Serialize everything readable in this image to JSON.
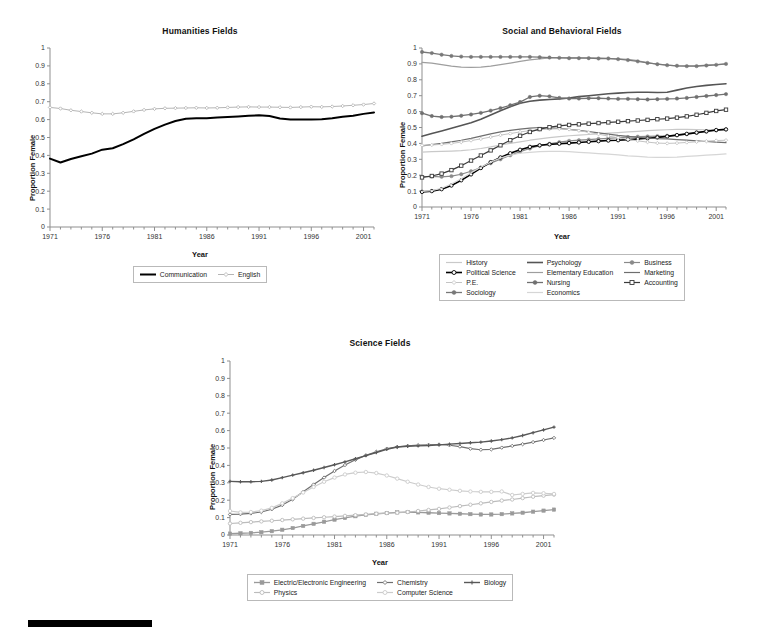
{
  "page": {
    "background": "#ffffff",
    "footer_rule": {
      "name": "black-rule",
      "color": "#000000"
    }
  },
  "charts": [
    {
      "id": "humanities",
      "title": "Humanities Fields",
      "xlabel": "Year",
      "ylabel": "Proportion Female",
      "ylim": [
        0,
        1
      ],
      "ytick_labels": [
        "1",
        "0.9",
        "0.8",
        "0.7",
        "0.6",
        "0.5",
        "0.4",
        "0.3",
        "0.2",
        "0.1",
        "0"
      ],
      "xlim": [
        1971,
        2002
      ],
      "xtick_labels": [
        "1971",
        "1976",
        "1981",
        "1986",
        "1991",
        "1996",
        "2001"
      ],
      "legend_columns": 2,
      "legend": [
        "Communication",
        "English"
      ]
    },
    {
      "id": "social",
      "title": "Social and Behavioral Fields",
      "xlabel": "Year",
      "ylabel": "Proportion Female",
      "ylim": [
        0,
        1
      ],
      "ytick_labels": [
        "1",
        "0.9",
        "0.8",
        "0.7",
        "0.6",
        "0.5",
        "0.4",
        "0.3",
        "0.2",
        "0.1",
        "0"
      ],
      "xlim": [
        1971,
        2002
      ],
      "xtick_labels": [
        "1971",
        "1976",
        "1981",
        "1986",
        "1991",
        "1996",
        "2001"
      ],
      "legend_columns": 3,
      "legend": [
        "History",
        "Psychology",
        "Business",
        "Political Science",
        "Elementary Education",
        "Marketing",
        "P.E.",
        "Nursing",
        "Accounting",
        "Sociology",
        "Economics"
      ]
    },
    {
      "id": "science",
      "title": "Science Fields",
      "xlabel": "Year",
      "ylabel": "Proportion Female",
      "ylim": [
        0,
        1
      ],
      "ytick_labels": [
        "1",
        "0.9",
        "0.8",
        "0.7",
        "0.6",
        "0.5",
        "0.4",
        "0.3",
        "0.2",
        "0.1",
        "0"
      ],
      "xlim": [
        1971,
        2002
      ],
      "xtick_labels": [
        "1971",
        "1976",
        "1981",
        "1986",
        "1991",
        "1996",
        "2001"
      ],
      "legend_columns": 3,
      "legend": [
        "Electric/Electronic Engineering",
        "Chemistry",
        "Biology",
        "Physics",
        "Computer Science"
      ]
    }
  ],
  "chart_data": [
    {
      "type": "line",
      "title": "Humanities Fields",
      "xlabel": "Year",
      "ylabel": "Proportion Female",
      "ylim": [
        0,
        1
      ],
      "xlim": [
        1971,
        2002
      ],
      "grid": false,
      "legend_position": "below",
      "x": [
        1971,
        1972,
        1973,
        1974,
        1975,
        1976,
        1977,
        1978,
        1979,
        1980,
        1981,
        1982,
        1983,
        1984,
        1985,
        1986,
        1987,
        1988,
        1989,
        1990,
        1991,
        1992,
        1993,
        1994,
        1995,
        1996,
        1997,
        1998,
        1999,
        2000,
        2001,
        2002
      ],
      "series": [
        {
          "name": "Communication",
          "color": "#000000",
          "marker": "none",
          "linewidth": 2.0,
          "values": [
            0.382,
            0.36,
            0.38,
            0.395,
            0.41,
            0.432,
            0.44,
            0.463,
            0.49,
            0.52,
            0.548,
            0.572,
            0.592,
            0.605,
            0.608,
            0.608,
            0.612,
            0.615,
            0.618,
            0.622,
            0.624,
            0.62,
            0.606,
            0.6,
            0.601,
            0.6,
            0.602,
            0.608,
            0.616,
            0.622,
            0.632,
            0.64
          ]
        },
        {
          "name": "English",
          "color": "#b5b5b5",
          "marker": "diamond",
          "linewidth": 1.0,
          "values": [
            0.668,
            0.662,
            0.652,
            0.645,
            0.638,
            0.632,
            0.632,
            0.638,
            0.646,
            0.654,
            0.66,
            0.663,
            0.664,
            0.665,
            0.666,
            0.665,
            0.666,
            0.668,
            0.67,
            0.671,
            0.67,
            0.67,
            0.669,
            0.668,
            0.67,
            0.672,
            0.671,
            0.673,
            0.676,
            0.68,
            0.684,
            0.69
          ]
        }
      ]
    },
    {
      "type": "line",
      "title": "Social and Behavioral Fields",
      "xlabel": "Year",
      "ylabel": "Proportion Female",
      "ylim": [
        0,
        1
      ],
      "xlim": [
        1971,
        2002
      ],
      "grid": false,
      "legend_position": "below",
      "x": [
        1971,
        1972,
        1973,
        1974,
        1975,
        1976,
        1977,
        1978,
        1979,
        1980,
        1981,
        1982,
        1983,
        1984,
        1985,
        1986,
        1987,
        1988,
        1989,
        1990,
        1991,
        1992,
        1993,
        1994,
        1995,
        1996,
        1997,
        1998,
        1999,
        2000,
        2001,
        2002
      ],
      "series": [
        {
          "name": "History",
          "color": "#c9c9c9",
          "marker": "none",
          "linewidth": 1.2,
          "values": [
            0.345,
            0.348,
            0.35,
            0.352,
            0.355,
            0.36,
            0.368,
            0.378,
            0.39,
            0.4,
            0.41,
            0.42,
            0.428,
            0.436,
            0.442,
            0.448,
            0.452,
            0.456,
            0.46,
            0.464,
            0.468,
            0.472,
            0.476,
            0.48,
            0.483,
            0.486,
            0.488,
            0.488,
            0.487,
            0.486,
            0.486,
            0.488
          ]
        },
        {
          "name": "Psychology",
          "color": "#555555",
          "marker": "none",
          "linewidth": 1.6,
          "values": [
            0.445,
            0.462,
            0.478,
            0.495,
            0.512,
            0.53,
            0.552,
            0.578,
            0.605,
            0.63,
            0.652,
            0.665,
            0.672,
            0.676,
            0.68,
            0.686,
            0.694,
            0.7,
            0.706,
            0.712,
            0.716,
            0.72,
            0.722,
            0.722,
            0.72,
            0.722,
            0.735,
            0.748,
            0.758,
            0.765,
            0.77,
            0.775
          ]
        },
        {
          "name": "Business",
          "color": "#8a8a8a",
          "marker": "circle-filled",
          "linewidth": 1.2,
          "values": [
            0.19,
            0.192,
            0.19,
            0.194,
            0.206,
            0.225,
            0.248,
            0.275,
            0.3,
            0.325,
            0.348,
            0.368,
            0.385,
            0.398,
            0.408,
            0.416,
            0.42,
            0.424,
            0.428,
            0.432,
            0.436,
            0.44,
            0.442,
            0.444,
            0.446,
            0.448,
            0.452,
            0.458,
            0.466,
            0.474,
            0.482,
            0.488
          ]
        },
        {
          "name": "Political Science",
          "color": "#000000",
          "marker": "circle-open",
          "linewidth": 1.6,
          "values": [
            0.095,
            0.1,
            0.112,
            0.135,
            0.168,
            0.205,
            0.245,
            0.282,
            0.312,
            0.338,
            0.36,
            0.378,
            0.388,
            0.394,
            0.398,
            0.402,
            0.406,
            0.41,
            0.414,
            0.418,
            0.42,
            0.424,
            0.428,
            0.432,
            0.438,
            0.444,
            0.452,
            0.46,
            0.468,
            0.476,
            0.484,
            0.488
          ]
        },
        {
          "name": "Elementary Education",
          "color": "#9e9e9e",
          "marker": "none",
          "linewidth": 1.2,
          "values": [
            0.91,
            0.905,
            0.895,
            0.886,
            0.88,
            0.878,
            0.88,
            0.886,
            0.895,
            0.905,
            0.916,
            0.925,
            0.932,
            0.938,
            0.94,
            0.94,
            0.94,
            0.938,
            0.936,
            0.934,
            0.932,
            0.928,
            0.92,
            0.908,
            0.898,
            0.892,
            0.888,
            0.888,
            0.888,
            0.892,
            0.896,
            0.9
          ]
        },
        {
          "name": "Marketing",
          "color": "#6e6e6e",
          "marker": "none",
          "linewidth": 1.2,
          "values": [
            0.385,
            0.392,
            0.4,
            0.41,
            0.42,
            0.432,
            0.446,
            0.46,
            0.472,
            0.482,
            0.49,
            0.496,
            0.5,
            0.498,
            0.494,
            0.488,
            0.482,
            0.474,
            0.466,
            0.458,
            0.45,
            0.444,
            0.438,
            0.434,
            0.43,
            0.428,
            0.424,
            0.42,
            0.416,
            0.412,
            0.408,
            0.405
          ]
        },
        {
          "name": "P.E.",
          "color": "#c4c4c4",
          "marker": "diamond",
          "linewidth": 1.0,
          "values": [
            0.388,
            0.39,
            0.394,
            0.4,
            0.408,
            0.418,
            0.428,
            0.44,
            0.452,
            0.462,
            0.472,
            0.48,
            0.486,
            0.49,
            0.492,
            0.488,
            0.48,
            0.47,
            0.458,
            0.446,
            0.436,
            0.425,
            0.416,
            0.408,
            0.402,
            0.4,
            0.402,
            0.406,
            0.41,
            0.414,
            0.418,
            0.42
          ]
        },
        {
          "name": "Nursing",
          "color": "#707070",
          "marker": "circle-filled",
          "linewidth": 1.3,
          "values": [
            0.59,
            0.572,
            0.566,
            0.568,
            0.574,
            0.582,
            0.592,
            0.606,
            0.622,
            0.64,
            0.66,
            0.692,
            0.7,
            0.696,
            0.686,
            0.682,
            0.682,
            0.684,
            0.684,
            0.682,
            0.68,
            0.68,
            0.678,
            0.676,
            0.678,
            0.68,
            0.682,
            0.686,
            0.692,
            0.698,
            0.704,
            0.71
          ]
        },
        {
          "name": "Accounting",
          "color": "#3a3a3a",
          "marker": "square-open",
          "linewidth": 1.2,
          "values": [
            0.186,
            0.195,
            0.21,
            0.232,
            0.26,
            0.292,
            0.324,
            0.356,
            0.388,
            0.42,
            0.448,
            0.472,
            0.49,
            0.502,
            0.51,
            0.516,
            0.52,
            0.524,
            0.528,
            0.532,
            0.536,
            0.54,
            0.544,
            0.548,
            0.552,
            0.556,
            0.562,
            0.57,
            0.58,
            0.592,
            0.604,
            0.612
          ]
        },
        {
          "name": "Sociology",
          "color": "#787878",
          "marker": "circle-filled",
          "linewidth": 1.3,
          "values": [
            0.975,
            0.968,
            0.958,
            0.95,
            0.946,
            0.944,
            0.944,
            0.944,
            0.944,
            0.944,
            0.944,
            0.944,
            0.942,
            0.94,
            0.938,
            0.936,
            0.936,
            0.936,
            0.934,
            0.934,
            0.93,
            0.924,
            0.916,
            0.906,
            0.898,
            0.892,
            0.888,
            0.886,
            0.886,
            0.89,
            0.894,
            0.9
          ]
        },
        {
          "name": "Economics",
          "color": "#d6d6d6",
          "marker": "none",
          "linewidth": 1.2,
          "values": [
            0.098,
            0.103,
            0.118,
            0.145,
            0.178,
            0.215,
            0.25,
            0.282,
            0.308,
            0.326,
            0.338,
            0.344,
            0.348,
            0.35,
            0.35,
            0.348,
            0.344,
            0.34,
            0.336,
            0.332,
            0.328,
            0.322,
            0.318,
            0.314,
            0.312,
            0.312,
            0.314,
            0.318,
            0.322,
            0.326,
            0.33,
            0.334
          ]
        }
      ]
    },
    {
      "type": "line",
      "title": "Science Fields",
      "xlabel": "Year",
      "ylabel": "Proportion Female",
      "ylim": [
        0,
        1
      ],
      "xlim": [
        1971,
        2002
      ],
      "grid": false,
      "legend_position": "below",
      "x": [
        1971,
        1972,
        1973,
        1974,
        1975,
        1976,
        1977,
        1978,
        1979,
        1980,
        1981,
        1982,
        1983,
        1984,
        1985,
        1986,
        1987,
        1988,
        1989,
        1990,
        1991,
        1992,
        1993,
        1994,
        1995,
        1996,
        1997,
        1998,
        1999,
        2000,
        2001,
        2002
      ],
      "series": [
        {
          "name": "Electric/Electronic Engineering",
          "color": "#9a9a9a",
          "marker": "square-filled",
          "linewidth": 1.3,
          "values": [
            0.008,
            0.01,
            0.012,
            0.016,
            0.022,
            0.03,
            0.04,
            0.052,
            0.064,
            0.076,
            0.088,
            0.098,
            0.108,
            0.116,
            0.122,
            0.126,
            0.13,
            0.132,
            0.13,
            0.128,
            0.126,
            0.124,
            0.122,
            0.12,
            0.118,
            0.118,
            0.12,
            0.124,
            0.128,
            0.134,
            0.14,
            0.146
          ]
        },
        {
          "name": "Chemistry",
          "color": "#6f6f6f",
          "marker": "diamond-open",
          "linewidth": 1.2,
          "values": [
            0.118,
            0.12,
            0.124,
            0.132,
            0.148,
            0.172,
            0.205,
            0.248,
            0.29,
            0.33,
            0.368,
            0.402,
            0.432,
            0.458,
            0.478,
            0.496,
            0.506,
            0.512,
            0.516,
            0.518,
            0.52,
            0.516,
            0.508,
            0.496,
            0.49,
            0.492,
            0.502,
            0.512,
            0.522,
            0.534,
            0.546,
            0.558
          ]
        },
        {
          "name": "Biology",
          "color": "#585858",
          "marker": "plus",
          "linewidth": 1.4,
          "values": [
            0.308,
            0.306,
            0.306,
            0.308,
            0.316,
            0.33,
            0.344,
            0.358,
            0.372,
            0.388,
            0.404,
            0.42,
            0.438,
            0.456,
            0.474,
            0.492,
            0.506,
            0.51,
            0.512,
            0.514,
            0.518,
            0.522,
            0.526,
            0.53,
            0.534,
            0.54,
            0.548,
            0.558,
            0.572,
            0.588,
            0.604,
            0.62
          ]
        },
        {
          "name": "Physics",
          "color": "#bcbcbc",
          "marker": "circle-open",
          "linewidth": 1.2,
          "values": [
            0.066,
            0.07,
            0.074,
            0.078,
            0.082,
            0.086,
            0.09,
            0.094,
            0.098,
            0.102,
            0.106,
            0.11,
            0.114,
            0.118,
            0.122,
            0.126,
            0.128,
            0.132,
            0.138,
            0.144,
            0.15,
            0.158,
            0.166,
            0.174,
            0.182,
            0.19,
            0.198,
            0.204,
            0.212,
            0.22,
            0.226,
            0.232
          ]
        },
        {
          "name": "Computer Science",
          "color": "#cccccc",
          "marker": "circle-open",
          "linewidth": 1.2,
          "values": [
            0.138,
            0.13,
            0.132,
            0.14,
            0.156,
            0.182,
            0.212,
            0.244,
            0.276,
            0.306,
            0.33,
            0.348,
            0.358,
            0.362,
            0.356,
            0.342,
            0.324,
            0.306,
            0.29,
            0.276,
            0.266,
            0.26,
            0.254,
            0.25,
            0.248,
            0.248,
            0.25,
            0.23,
            0.236,
            0.242,
            0.24,
            0.236
          ]
        }
      ]
    }
  ]
}
